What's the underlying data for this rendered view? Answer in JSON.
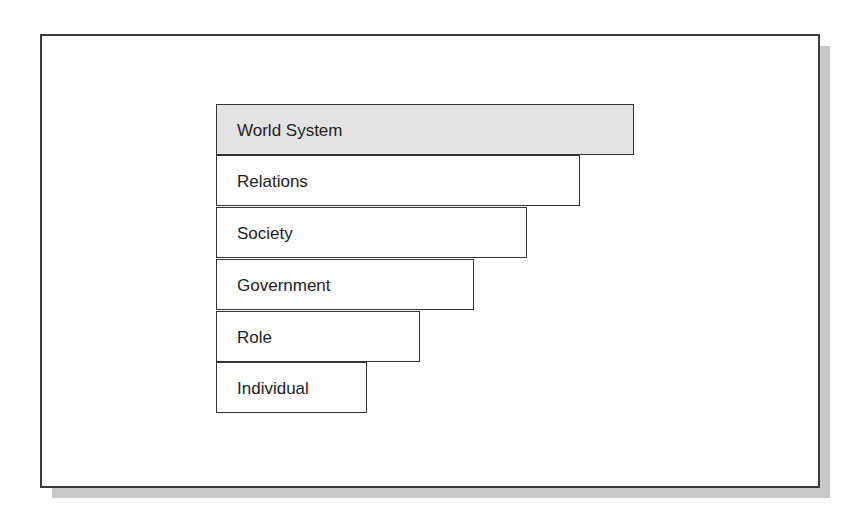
{
  "diagram": {
    "type": "levels-of-analysis staircase",
    "levels": [
      {
        "label": "World System",
        "highlighted": true,
        "order": 1
      },
      {
        "label": "Relations",
        "highlighted": false,
        "order": 2
      },
      {
        "label": "Society",
        "highlighted": false,
        "order": 3
      },
      {
        "label": "Government",
        "highlighted": false,
        "order": 4
      },
      {
        "label": "Role",
        "highlighted": false,
        "order": 5
      },
      {
        "label": "Individual",
        "highlighted": false,
        "order": 6
      }
    ],
    "colors": {
      "highlight_fill": "#e3e3e3",
      "box_fill": "#ffffff",
      "border": "#333333",
      "shadow": "#c9c9c9"
    }
  }
}
